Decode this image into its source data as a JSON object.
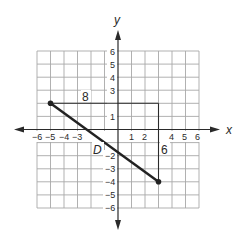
{
  "diagram": {
    "type": "coordinate-plane",
    "axes": {
      "x_label": "x",
      "y_label": "y",
      "x_range": [
        -6,
        6
      ],
      "y_range": [
        -6,
        6
      ],
      "x_tick_labels": [
        "-6",
        "-5",
        "-4",
        "-3",
        "1",
        "2",
        "4",
        "5",
        "6"
      ],
      "y_tick_labels": [
        "6",
        "5",
        "4",
        "3",
        "1",
        "-2",
        "-3",
        "-4",
        "-5",
        "-6"
      ]
    },
    "points": [
      {
        "x": -5,
        "y": 2
      },
      {
        "x": 3,
        "y": -4
      }
    ],
    "segment": {
      "from": [
        -5,
        2
      ],
      "to": [
        3,
        -4
      ],
      "label": "D"
    },
    "right_triangle": {
      "horizontal_leg": {
        "from": [
          -5,
          2
        ],
        "to": [
          3,
          2
        ],
        "label": "8"
      },
      "vertical_leg": {
        "from": [
          3,
          2
        ],
        "to": [
          3,
          -4
        ],
        "label": "6"
      }
    }
  },
  "labels": {
    "x_axis": "x",
    "y_axis": "y",
    "distance": "D",
    "horizontal": "8",
    "vertical": "6",
    "xt_m6": "−6",
    "xt_m5": "−5",
    "xt_m4": "−4",
    "xt_m3": "−3",
    "xt_1": "1",
    "xt_2": "2",
    "xt_4": "4",
    "xt_5": "5",
    "xt_6": "6",
    "yt_6": "6",
    "yt_5": "5",
    "yt_4": "4",
    "yt_3": "3",
    "yt_1": "1",
    "yt_m2": "−2",
    "yt_m3": "−3",
    "yt_m4": "−4",
    "yt_m5": "−5",
    "yt_m6": "−6"
  },
  "colors": {
    "grid": "#a8a8a8",
    "axis": "#2a2a2a",
    "segment": "#222222",
    "background": "#ffffff"
  }
}
